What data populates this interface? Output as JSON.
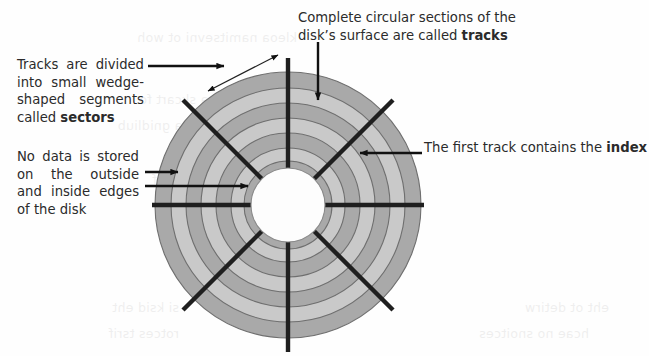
{
  "diagram": {
    "callouts": [
      {
        "id": "sectors",
        "name": "callout-sectors",
        "text_before": "Tracks are divided into small wedge-shaped segments called ",
        "emphasis": "sectors",
        "text_after": ""
      },
      {
        "id": "no-data",
        "name": "callout-no-data",
        "text_before": "No data is stored on the outside and inside edges of the disk",
        "emphasis": "",
        "text_after": ""
      },
      {
        "id": "tracks",
        "name": "callout-tracks",
        "text_before": "Complete circular sections of the disk’s surface are called ",
        "emphasis": "tracks",
        "text_after": ""
      },
      {
        "id": "index",
        "name": "callout-index",
        "text_before": "The first track contains the ",
        "emphasis": "index",
        "text_after": ""
      }
    ],
    "disk": {
      "center_x": 288,
      "center_y": 205,
      "outer_radius": 133,
      "hub_radius": 37,
      "track_count": 7,
      "sector_count": 6,
      "ring_color_dark": "#a9a9a9",
      "ring_color_light": "#c9c9c9",
      "ring_outline_color": "#6f6f6f",
      "hub_color": "#fdfdfd",
      "sector_line_color": "#1f1f1f",
      "arrow_color": "#111111",
      "track_radii": [
        133,
        117,
        102,
        87,
        72,
        57,
        44,
        37
      ],
      "sector_angles_deg": [
        90,
        150,
        210,
        270,
        330,
        30
      ]
    },
    "ghost_text": [
      {
        "text": "kleoa namitsevni ot woh",
        "x": 352,
        "y": 30
      },
      {
        "text": "srotcev dna skcart fo",
        "x": 372,
        "y": 92
      },
      {
        "text": "retupmoc a gnidliub",
        "x": 400,
        "y": 118
      },
      {
        "text": "ksid drah eht si ti",
        "x": 360,
        "y": 146
      },
      {
        "text": "egarots atad rof",
        "x": 392,
        "y": 172
      },
      {
        "text": "ecafrus gnitator",
        "x": 356,
        "y": 212
      },
      {
        "text": "dellac snoitces",
        "x": 388,
        "y": 238
      },
      {
        "text": "eht ot detirw",
        "x": 40,
        "y": 300
      },
      {
        "text": "hcae no snoitces",
        "x": 60,
        "y": 326
      },
      {
        "text": "si ksid eht",
        "x": 470,
        "y": 300
      },
      {
        "text": "rotces tsrif",
        "x": 470,
        "y": 326
      }
    ]
  }
}
